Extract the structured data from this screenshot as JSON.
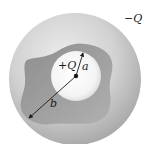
{
  "diagram": {
    "outer_charge_label": "−Q",
    "inner_charge_label": "+Q",
    "radius_a_label": "a",
    "radius_b_label": "b"
  },
  "colors": {
    "background": "#ffffff",
    "outer_shell_light": "#e4e4e4",
    "outer_shell_dark": "#a8a8a8",
    "cavity": "#9a9a9a",
    "cavity_dark": "#8c8c8c",
    "inner_sphere_light": "#ffffff",
    "inner_sphere_edge": "#dedede",
    "arrow": "#1a1a1a"
  }
}
